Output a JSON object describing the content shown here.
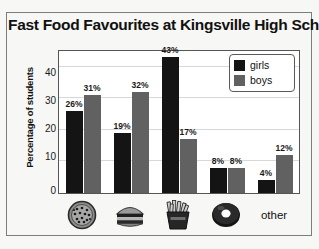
{
  "chart_data": {
    "type": "bar",
    "title": "Fast Food Favourites at Kingsville High School",
    "xlabel": "",
    "ylabel": "Percentage of students",
    "ylim": [
      0,
      45
    ],
    "yticks": [
      0,
      10,
      20,
      30,
      40
    ],
    "grid": true,
    "legend_position": "top-right",
    "categories": [
      "pizza",
      "hamburger",
      "fries",
      "donut",
      "other"
    ],
    "category_labels": [
      "",
      "",
      "",
      "",
      "other"
    ],
    "category_icons": [
      "pizza-icon",
      "hamburger-icon",
      "fries-icon",
      "donut-icon",
      null
    ],
    "series": [
      {
        "name": "girls",
        "color": "#141414",
        "values": [
          26,
          19,
          43,
          8,
          4
        ]
      },
      {
        "name": "boys",
        "color": "#616161",
        "values": [
          31,
          32,
          17,
          8,
          12
        ]
      }
    ],
    "value_labels": {
      "girls": [
        "26%",
        "19%",
        "43%",
        "8%",
        "4%"
      ],
      "boys": [
        "31%",
        "32%",
        "17%",
        "8%",
        "12%"
      ]
    }
  },
  "legend": {
    "items": [
      {
        "label": "girls",
        "color": "#141414"
      },
      {
        "label": "boys",
        "color": "#616161"
      }
    ]
  },
  "axis": {
    "y_tick_labels": [
      "40",
      "30",
      "20",
      "10",
      "0"
    ]
  },
  "colors": {
    "girls": "#141414",
    "boys": "#616161",
    "frame": "#7d7d7d",
    "plot_border": "#555555",
    "grid": "#d8d8d8",
    "page_background": "#f7f7f5"
  }
}
